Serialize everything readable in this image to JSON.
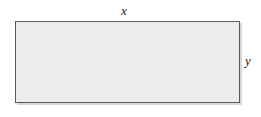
{
  "figure": {
    "type": "geometry-diagram",
    "shape": "rectangle",
    "background_color": "#ffffff",
    "fill_color": "#ececec",
    "stroke_color": "#5a5a5a",
    "label_color": "#1a1a1a",
    "labels": {
      "width": "x",
      "height": "y"
    },
    "label_positions": {
      "width": "above-top-edge-center",
      "height": "right-of-right-edge-middle"
    }
  }
}
